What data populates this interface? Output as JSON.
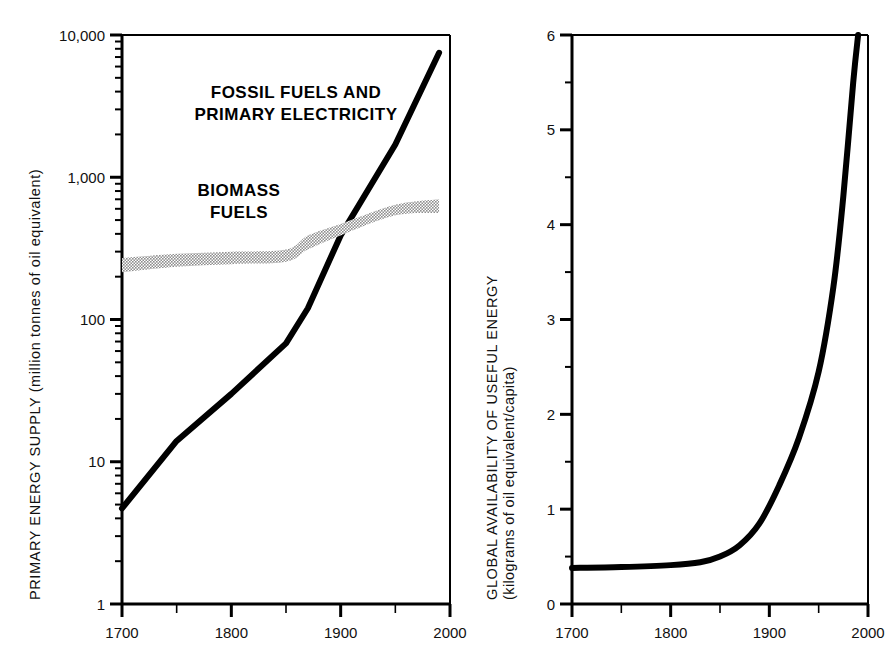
{
  "figure": {
    "panels": [
      "left-panel",
      "right-panel"
    ]
  },
  "chart_data": [
    {
      "id": "primary-energy-supply",
      "type": "line",
      "title": "",
      "xlabel": "",
      "ylabel": "PRIMARY ENERGY SUPPLY",
      "ylabel_units": "(million tonnes of oil equivalent)",
      "yscale": "log",
      "xscale": "linear",
      "xlim": [
        1700,
        2000
      ],
      "ylim": [
        1,
        10000
      ],
      "grid": false,
      "legend": "inline-annotations",
      "xticks": [
        1700,
        1800,
        1900,
        2000
      ],
      "xtick_labels": [
        "1700",
        "1800",
        "1900",
        "2000"
      ],
      "xminor_ticks": [
        1750,
        1850,
        1950
      ],
      "yticks": [
        1,
        10,
        100,
        1000,
        10000
      ],
      "ytick_labels": [
        "1",
        "10",
        "100",
        "1,000",
        "10,000"
      ],
      "series": [
        {
          "name": "FOSSIL FUELS AND PRIMARY ELECTRICITY",
          "label_lines": [
            "FOSSIL FUELS AND",
            "PRIMARY ELECTRICITY"
          ],
          "color": "#000000",
          "style": "thick-line",
          "x": [
            1700,
            1750,
            1800,
            1850,
            1870,
            1900,
            1950,
            1990
          ],
          "values": [
            4.7,
            14,
            30,
            68,
            120,
            390,
            1700,
            7500
          ]
        },
        {
          "name": "BIOMASS FUELS",
          "label_lines": [
            "BIOMASS",
            "FUELS"
          ],
          "color": "#b0b0b0",
          "style": "shaded-band",
          "x": [
            1700,
            1750,
            1800,
            1850,
            1870,
            1900,
            1950,
            1990
          ],
          "upper": [
            270,
            290,
            300,
            310,
            390,
            470,
            640,
            700
          ],
          "lower": [
            215,
            235,
            245,
            255,
            310,
            390,
            540,
            560
          ]
        }
      ]
    },
    {
      "id": "global-availability-useful-energy",
      "type": "line",
      "title": "",
      "xlabel": "",
      "ylabel": "GLOBAL AVAILABILITY OF USEFUL ENERGY",
      "ylabel_units": "(kilograms of oil equivalent/capita)",
      "yscale": "linear",
      "xscale": "linear",
      "xlim": [
        1700,
        2000
      ],
      "ylim": [
        0,
        6
      ],
      "grid": false,
      "legend": "none",
      "xticks": [
        1700,
        1800,
        1900,
        2000
      ],
      "xtick_labels": [
        "1700",
        "1800",
        "1900",
        "2000"
      ],
      "xminor_ticks": [
        1750,
        1850,
        1950
      ],
      "yticks": [
        0,
        1,
        2,
        3,
        4,
        5,
        6
      ],
      "ytick_labels": [
        "0",
        "1",
        "2",
        "3",
        "4",
        "5",
        "6"
      ],
      "series": [
        {
          "name": "Global availability of useful energy",
          "color": "#000000",
          "style": "thick-line",
          "x": [
            1700,
            1750,
            1800,
            1830,
            1850,
            1870,
            1890,
            1910,
            1930,
            1950,
            1965,
            1975,
            1985,
            1990
          ],
          "values": [
            0.38,
            0.39,
            0.41,
            0.44,
            0.5,
            0.62,
            0.85,
            1.25,
            1.75,
            2.45,
            3.35,
            4.3,
            5.5,
            6.0
          ]
        }
      ]
    }
  ]
}
